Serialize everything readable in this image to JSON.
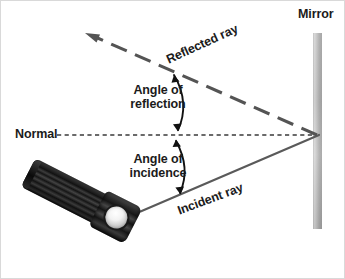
{
  "diagram": {
    "background_color": "#ffffff",
    "border_color": "#d9d9d9"
  },
  "labels": {
    "mirror": "Mirror",
    "normal": "Normal",
    "angle_of_reflection_line1": "Angle of",
    "angle_of_reflection_line2": "reflection",
    "angle_of_incidence_line1": "Angle of",
    "angle_of_incidence_line2": "incidence",
    "reflected_ray": "Reflected ray",
    "incident_ray": "Incident ray"
  },
  "colors": {
    "ray_gray": "#5a5a5a",
    "reflected_dash": "#545454",
    "normal_dash": "#3a3a3a",
    "arc_arrow": "#111111",
    "mirror_light": "#e2e2e2",
    "mirror_mid": "#9a9a9a",
    "mirror_dark": "#b4b4b4",
    "text": "#1b1b1b",
    "flashlight_black": "#111111",
    "bulb_white": "#ffffff"
  },
  "geometry": {
    "mirror": {
      "x": 312,
      "y_top": 32,
      "y_bottom": 228,
      "width": 9
    },
    "reflection_point": {
      "x": 318,
      "y": 134
    },
    "incident_ray_start": {
      "x": 136,
      "y": 212
    },
    "reflected_ray_end": {
      "x": 86,
      "y": 33
    },
    "normal_line": {
      "x_start": 56,
      "x_end": 316,
      "y": 134
    },
    "incidence_angle_deg": 20.5,
    "reflection_angle_deg": 24.5
  },
  "icons": {
    "flashlight": "flashlight-icon",
    "mirror_bar": "mirror-bar-icon",
    "arrowhead_reflected": "arrow-up-left-icon",
    "arc_double_arrow_upper": "arc-double-arrow-icon",
    "arc_double_arrow_lower": "arc-double-arrow-icon"
  }
}
